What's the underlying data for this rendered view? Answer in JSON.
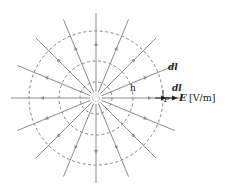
{
  "diagram": {
    "center": {
      "x": 96,
      "y": 98
    },
    "field_lines": {
      "count": 16,
      "length": 85,
      "direction": "outward",
      "color": "#8a8a8a"
    },
    "equipotentials": {
      "radii": [
        16,
        37,
        67
      ],
      "style": "dashed",
      "color": "#666666"
    },
    "labels": {
      "dl_upper": "dl",
      "dl_near_p": "dl",
      "h": "h",
      "p": "P",
      "e_symbol": "E",
      "e_units": "[V/m]"
    }
  }
}
